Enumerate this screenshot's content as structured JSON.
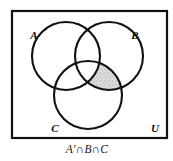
{
  "figure": {
    "type": "venn-diagram",
    "title": "",
    "caption": "A'∩B∩C",
    "universe_label": "U",
    "shaded_description": "B ∩ C excluding A",
    "colors": {
      "stroke": "#111111",
      "background": "#ffffff",
      "shade_fill": "#d9d9d9",
      "shade_speckle": "#9a9a9a"
    },
    "frame": {
      "x": 12,
      "y": 11,
      "width": 155,
      "height": 127
    },
    "sets": [
      {
        "label": "A",
        "cx": 66,
        "cy": 56,
        "r": 34,
        "label_x": 34,
        "label_y": 39
      },
      {
        "label": "B",
        "cx": 109,
        "cy": 56,
        "r": 34,
        "label_x": 135,
        "label_y": 39
      },
      {
        "label": "C",
        "cx": 88,
        "cy": 95,
        "r": 34,
        "label_x": 55,
        "label_y": 132
      }
    ],
    "universe": {
      "x": 155,
      "y": 132
    },
    "caption_position": {
      "x": 87,
      "y": 153
    }
  }
}
